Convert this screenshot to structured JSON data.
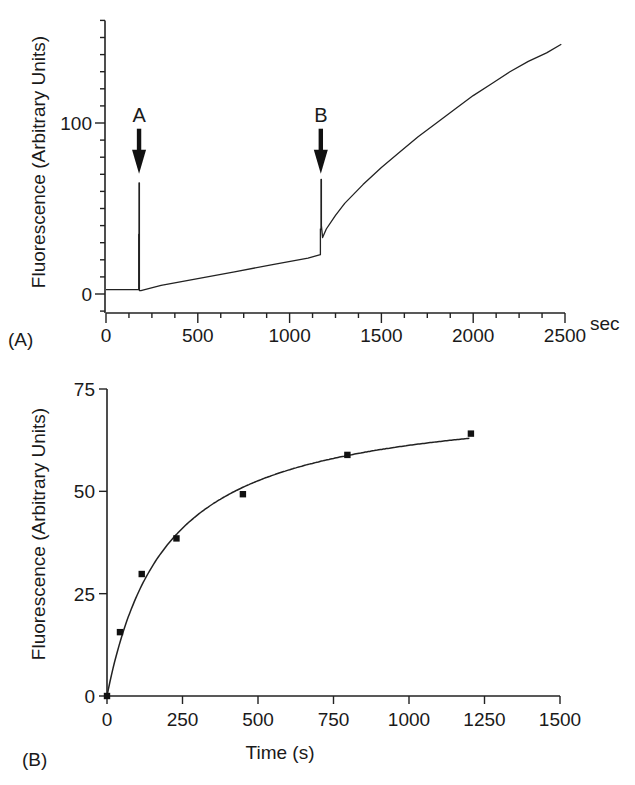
{
  "chart_data": [
    {
      "panel": "(A)",
      "type": "line",
      "title": "",
      "xlabel": "",
      "x_unit_label": "sec",
      "ylabel": "Fluorescence (Arbitrary Units)",
      "xlim": [
        0,
        2500
      ],
      "ylim": [
        -10,
        160
      ],
      "x_ticks": [
        0,
        500,
        1000,
        1500,
        2000,
        2500
      ],
      "x_minor_step": 125,
      "y_ticks": [
        0,
        100
      ],
      "y_minor_step": 10,
      "grid": false,
      "annotations": [
        {
          "label": "A",
          "x": 180,
          "arrow_to_value": 68
        },
        {
          "label": "B",
          "x": 1170,
          "arrow_to_value": 68
        }
      ],
      "series": [
        {
          "name": "fluorescence trace",
          "x": [
            0,
            175,
            178,
            178,
            180,
            180,
            182,
            182,
            190,
            300,
            500,
            700,
            900,
            1100,
            1168,
            1168,
            1171,
            1171,
            1173,
            1173,
            1180,
            1200,
            1250,
            1300,
            1400,
            1500,
            1600,
            1700,
            1800,
            1900,
            2000,
            2100,
            2200,
            2300,
            2400,
            2480
          ],
          "y": [
            2.5,
            2.5,
            2.5,
            35,
            35,
            65,
            65,
            2,
            2,
            5,
            9,
            13,
            17,
            21,
            23,
            38,
            38,
            67,
            67,
            40,
            33,
            38,
            46,
            53,
            64,
            74,
            83,
            92,
            100,
            108,
            116,
            123,
            130,
            136,
            141,
            146
          ]
        }
      ]
    },
    {
      "panel": "(B)",
      "type": "scatter",
      "title": "",
      "xlabel": "Time (s)",
      "ylabel": "Fluorescence (Arbitrary Units)",
      "xlim": [
        0,
        1500
      ],
      "ylim": [
        0,
        75
      ],
      "x_ticks": [
        0,
        250,
        500,
        750,
        1000,
        1250,
        1500
      ],
      "y_ticks": [
        0,
        25,
        50,
        75
      ],
      "grid": false,
      "series": [
        {
          "name": "data points",
          "marker": "square",
          "x": [
            0,
            43,
            115,
            230,
            450,
            796,
            1205
          ],
          "y": [
            0,
            15.6,
            29.8,
            38.5,
            49.3,
            58.9,
            64.1
          ]
        },
        {
          "name": "hyperbolic fit",
          "type": "line",
          "equation": "y = 73.3*t/(197+t)",
          "vmax": 73.3,
          "k": 197,
          "x_range": [
            0,
            1200
          ]
        }
      ]
    }
  ],
  "figure": {
    "panelA": {
      "panel_label": "(A)",
      "y_axis_label": "Fluorescence (Arbitrary Units)",
      "x_unit": "sec",
      "x_tick_labels": [
        "0",
        "500",
        "1000",
        "1500",
        "2000",
        "2500"
      ],
      "y_tick_labels": [
        "0",
        "100"
      ],
      "arrow_A": "A",
      "arrow_B": "B"
    },
    "panelB": {
      "panel_label": "(B)",
      "y_axis_label": "Fluorescence (Arbitrary Units)",
      "x_axis_label": "Time (s)",
      "x_tick_labels": [
        "0",
        "250",
        "500",
        "750",
        "1000",
        "1250",
        "1500"
      ],
      "y_tick_labels": [
        "0",
        "25",
        "50",
        "75"
      ]
    }
  }
}
